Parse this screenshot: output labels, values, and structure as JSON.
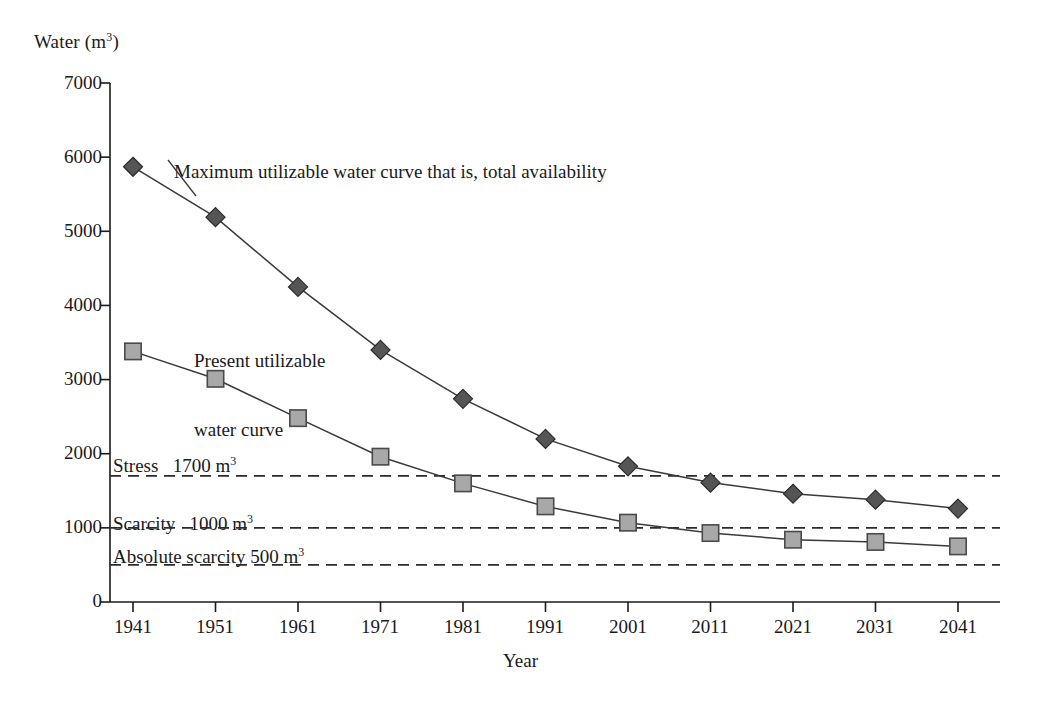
{
  "chart_data": {
    "type": "line",
    "title": "",
    "xlabel": "Year",
    "ylabel": "Water (m3)",
    "ylabel_display": "Water (m",
    "ylabel_sup": "3",
    "ylabel_suffix": ")",
    "x": [
      1941,
      1951,
      1961,
      1971,
      1981,
      1991,
      2001,
      2011,
      2021,
      2031,
      2041
    ],
    "categories": [
      "1941",
      "1951",
      "1961",
      "1971",
      "1981",
      "1991",
      "2001",
      "2011",
      "2021",
      "2031",
      "2041"
    ],
    "xlim": [
      1941,
      2041
    ],
    "ylim": [
      0,
      7000
    ],
    "yticks": [
      0,
      1000,
      2000,
      3000,
      4000,
      5000,
      6000,
      7000
    ],
    "ytick_labels": [
      "0",
      "1000",
      "2000",
      "3000",
      "4000",
      "5000",
      "6000",
      "7000"
    ],
    "grid": false,
    "legend_position": "inline-annotations",
    "series": [
      {
        "name": "Maximum utilizable water curve that is, total availability",
        "marker": "diamond",
        "color": "#555555",
        "values": [
          5870,
          5190,
          4250,
          3400,
          2740,
          2200,
          1830,
          1610,
          1460,
          1380,
          1260
        ]
      },
      {
        "name": "Present utilizable water curve",
        "marker": "square",
        "color": "#a8a8a8",
        "values": [
          3380,
          3010,
          2480,
          1960,
          1600,
          1290,
          1070,
          930,
          840,
          810,
          750
        ]
      }
    ],
    "threshold_lines": [
      {
        "label": "Stress",
        "value": 1700,
        "value_label": "1700 m",
        "value_sup": "3",
        "style": "dashed"
      },
      {
        "label": "Scarcity",
        "value": 1000,
        "value_label": "1000 m",
        "value_sup": "3",
        "style": "dashed"
      },
      {
        "label": "Absolute scarcity",
        "value": 500,
        "value_label": "500 m",
        "value_sup": "3",
        "style": "dashed"
      }
    ],
    "annotations": [
      {
        "text": "Maximum utilizable water curve that is, total availability",
        "anchor_x": 1941,
        "anchor_y": 5870
      },
      {
        "text": "Present utilizable\nwater curve",
        "anchor_x": 1941,
        "anchor_y": 3380
      }
    ]
  },
  "annotations": {
    "max_curve_label": "Maximum utilizable water curve that is, total availability",
    "present_curve_line1": "Present utilizable",
    "present_curve_line2": "water curve",
    "stress_label": "Stress",
    "stress_value": "1700 m",
    "stress_sup": "3",
    "scarcity_label": "Scarcity",
    "scarcity_value": "1000 m",
    "scarcity_sup": "3",
    "absolute_label": "Absolute scarcity 500 m",
    "absolute_sup": "3"
  },
  "axes": {
    "y_title_main": "Water (m",
    "y_title_sup": "3",
    "y_title_end": ")",
    "x_title": "Year"
  },
  "colors": {
    "axis": "#1a1a1a",
    "diamond_fill": "#555555",
    "square_fill": "#a8a8a8",
    "line": "#3a3a3a",
    "dash": "#2b2b2b"
  }
}
